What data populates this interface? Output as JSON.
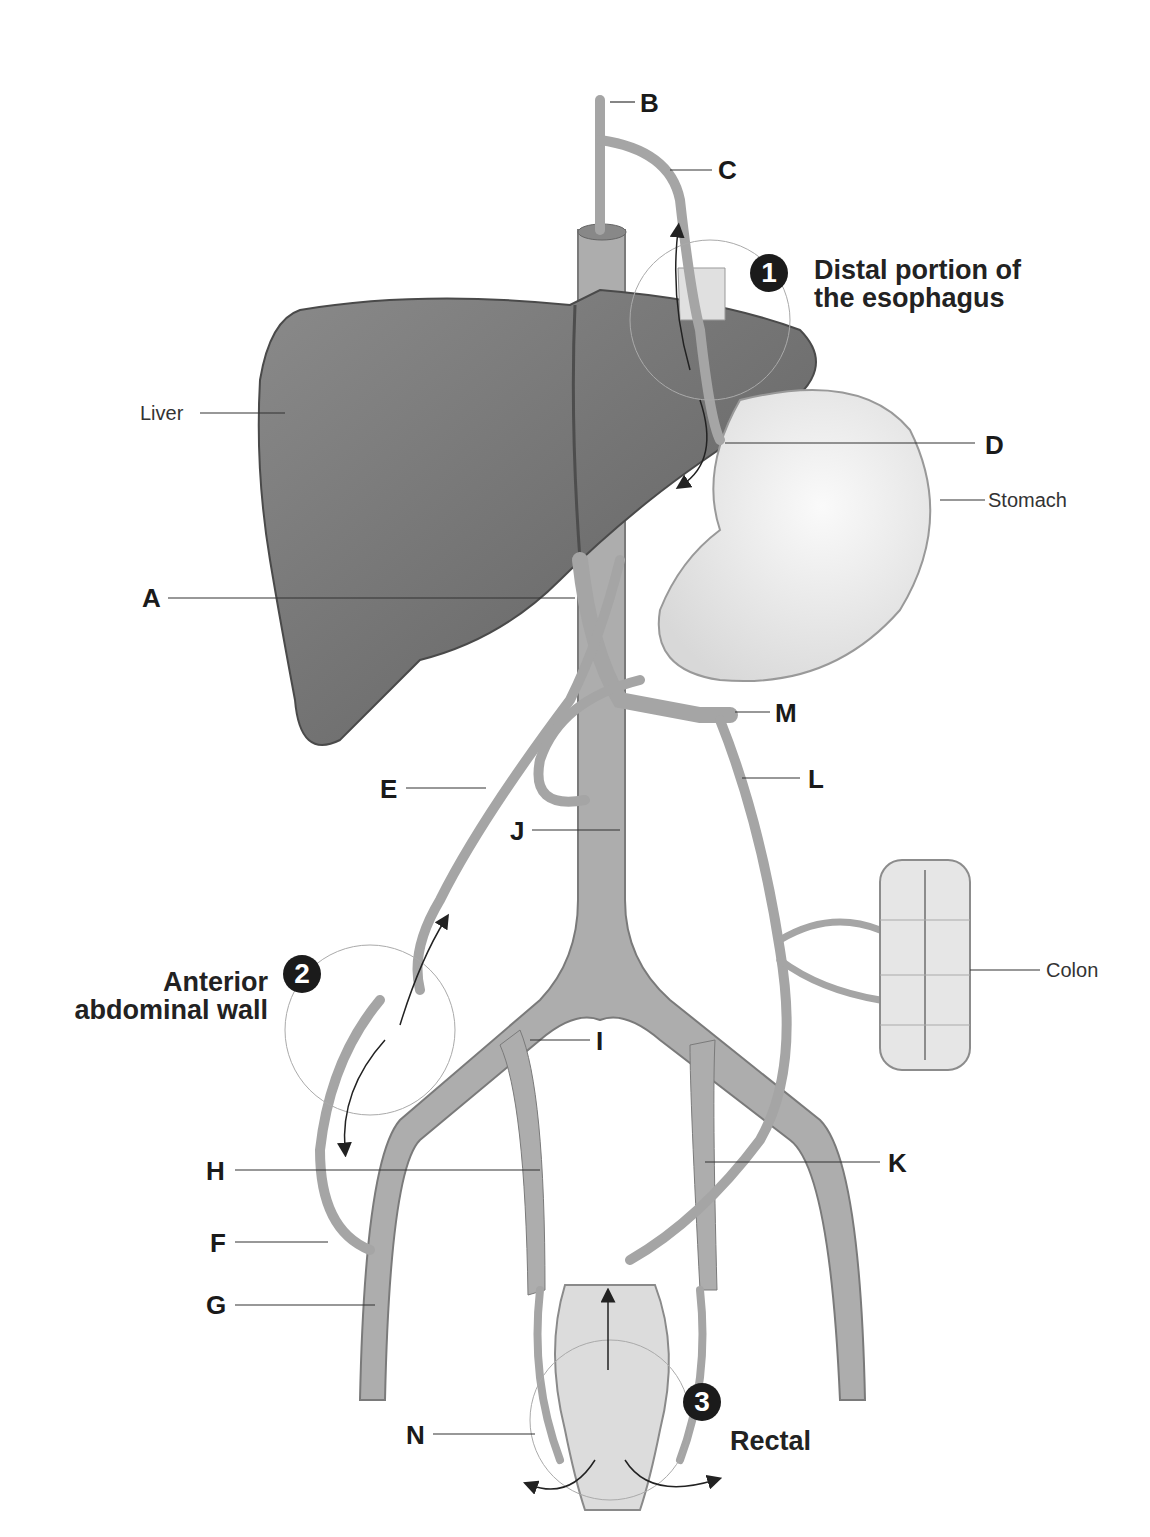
{
  "diagram": {
    "sites": [
      {
        "number": "1",
        "label_line1": "Distal portion of",
        "label_line2": "the esophagus"
      },
      {
        "number": "2",
        "label_line1": "Anterior",
        "label_line2": "abdominal wall"
      },
      {
        "number": "3",
        "label_line1": "Rectal",
        "label_line2": ""
      }
    ],
    "organs": {
      "liver": "Liver",
      "stomach": "Stomach",
      "colon": "Colon"
    },
    "letters": {
      "A": "A",
      "B": "B",
      "C": "C",
      "D": "D",
      "E": "E",
      "F": "F",
      "G": "G",
      "H": "H",
      "I": "I",
      "J": "J",
      "K": "K",
      "L": "L",
      "M": "M",
      "N": "N"
    },
    "colors": {
      "vessel": "#a9a9a9",
      "vessel_edge": "#7d7d7d",
      "liver": "#6f6f6f",
      "stomach": "#ebebeb",
      "leader_line": "#333333",
      "badge": "#1b1b1b"
    }
  }
}
